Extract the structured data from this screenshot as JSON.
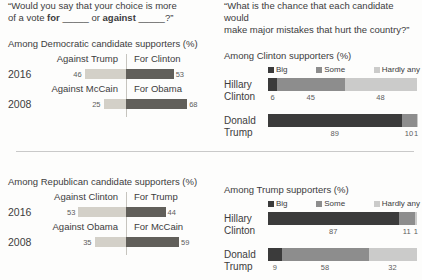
{
  "colors": {
    "against_bar": "#d3d0c8",
    "for_bar": "#615f5a",
    "big": "#3b3b3b",
    "some": "#8d8d8d",
    "hardly_any": "#cbcbca",
    "axis_line": "#c6c4be",
    "divider": "#c9c9c9"
  },
  "left_question": {
    "line1": "“Would you say that your choice is more",
    "l2_p1": "of a vote ",
    "l2_b1": "for",
    "l2_u1": " _____ ",
    "l2_p2": "or ",
    "l2_b2": "against",
    "l2_u2": " _____?”"
  },
  "right_question": {
    "line1": "“What is the chance that each candidate would",
    "line2": "make major mistakes that hurt the country?”"
  },
  "chart_data": [
    {
      "type": "bar",
      "subtype": "paired-diverging-horizontal",
      "title": "Among Democratic candidate supporters (%)",
      "axis": "center-divider",
      "rows": [
        {
          "year": "2016",
          "left_header": "Against Trump",
          "right_header": "For Clinton",
          "left": 46,
          "right": 53
        },
        {
          "year": "2008",
          "left_header": "Against McCain",
          "right_header": "For Obama",
          "left": 25,
          "right": 68
        }
      ]
    },
    {
      "type": "bar",
      "subtype": "stacked-horizontal",
      "title": "Among Clinton supporters (%)",
      "legend": [
        "Big",
        "Some",
        "Hardly any"
      ],
      "categories": [
        "Hillary Clinton",
        "Donald Trump"
      ],
      "xlim": [
        0,
        100
      ],
      "series": [
        {
          "name": "Big",
          "values": [
            6,
            89
          ]
        },
        {
          "name": "Some",
          "values": [
            45,
            10
          ]
        },
        {
          "name": "Hardly any",
          "values": [
            48,
            1
          ]
        }
      ]
    },
    {
      "type": "bar",
      "subtype": "paired-diverging-horizontal",
      "title": "Among Republican candidate supporters (%)",
      "axis": "center-divider",
      "rows": [
        {
          "year": "2016",
          "left_header": "Against Clinton",
          "right_header": "For Trump",
          "left": 53,
          "right": 44
        },
        {
          "year": "2008",
          "left_header": "Against Obama",
          "right_header": "For McCain",
          "left": 35,
          "right": 59
        }
      ]
    },
    {
      "type": "bar",
      "subtype": "stacked-horizontal",
      "title": "Among Trump supporters (%)",
      "legend": [
        "Big",
        "Some",
        "Hardly any"
      ],
      "categories": [
        "Hillary Clinton",
        "Donald Trump"
      ],
      "xlim": [
        0,
        100
      ],
      "series": [
        {
          "name": "Big",
          "values": [
            87,
            9
          ]
        },
        {
          "name": "Some",
          "values": [
            11,
            58
          ]
        },
        {
          "name": "Hardly any",
          "values": [
            1,
            32
          ]
        }
      ]
    }
  ]
}
